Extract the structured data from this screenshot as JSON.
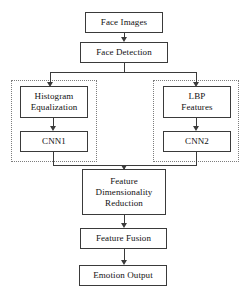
{
  "diagram": {
    "orientation": "top-to-bottom",
    "colors": {
      "node_border": "#3a3a3a",
      "group_border": "#7d7d7d",
      "background": "#ffffff",
      "text": "#111111"
    },
    "nodes": {
      "face_images": "Face Images",
      "face_detection": "Face Detection",
      "histogram_equalization": "Histogram\nEqualization",
      "cnn1": "CNN1",
      "lbp_features": "LBP\nFeatures",
      "cnn2": "CNN2",
      "feature_dimensionality_reduction": "Feature\nDimensionality\nReduction",
      "feature_fusion": "Feature Fusion",
      "emotion_output": "Emotion Output"
    },
    "groups": {
      "left_branch": "",
      "right_branch": ""
    },
    "edges": [
      {
        "from": "Face Images",
        "to": "Face Detection"
      },
      {
        "from": "Face Detection",
        "to": "Histogram Equalization"
      },
      {
        "from": "Face Detection",
        "to": "LBP Features"
      },
      {
        "from": "Histogram Equalization",
        "to": "CNN1"
      },
      {
        "from": "LBP Features",
        "to": "CNN2"
      },
      {
        "from": "CNN1",
        "to": "Feature Dimensionality Reduction"
      },
      {
        "from": "CNN2",
        "to": "Feature Dimensionality Reduction"
      },
      {
        "from": "Feature Dimensionality Reduction",
        "to": "Feature Fusion"
      },
      {
        "from": "Feature Fusion",
        "to": "Emotion Output"
      }
    ]
  }
}
